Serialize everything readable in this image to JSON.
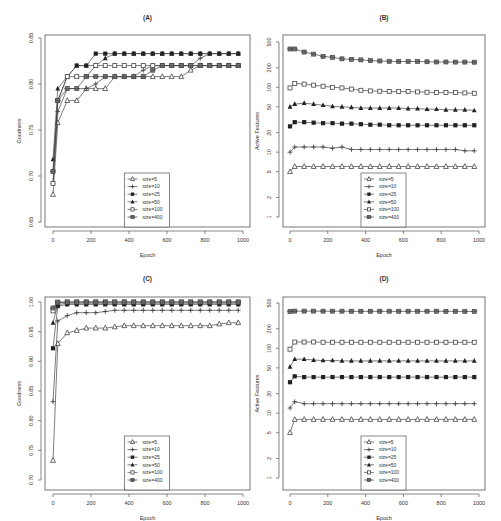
{
  "figure": {
    "panels_order": [
      "A",
      "B",
      "C",
      "D"
    ]
  },
  "legend": {
    "entries": [
      {
        "label": "size=5",
        "marker": "open-triangle"
      },
      {
        "label": "size=10",
        "marker": "plus"
      },
      {
        "label": "size=25",
        "marker": "filled-square"
      },
      {
        "label": "size=50",
        "marker": "filled-triangle"
      },
      {
        "label": "size=100",
        "marker": "open-square"
      },
      {
        "label": "size=400",
        "marker": "square-cross"
      }
    ]
  },
  "colors": {
    "line": "#444444",
    "axis": "#555555",
    "text": "#333333",
    "marker_fill": "#222222",
    "marker_open_fill": "#ffffff"
  },
  "chart_data": [
    {
      "id": "A",
      "title": "(A)",
      "type": "line",
      "xlabel": "Epoch",
      "ylabel": "Goodness",
      "yscale": "linear",
      "xlim": [
        0,
        1000
      ],
      "ylim": [
        0.65,
        0.85
      ],
      "xticks": [
        0,
        200,
        400,
        600,
        800,
        1000
      ],
      "yticks": [
        0.65,
        0.7,
        0.75,
        0.8,
        0.85
      ],
      "ytick_labels": [
        "0.65",
        "0.70",
        "0.75",
        "0.80",
        "0.85"
      ],
      "grid": false,
      "legend_position": "bottom-center",
      "x": [
        0,
        25,
        75,
        125,
        175,
        225,
        275,
        325,
        375,
        425,
        475,
        525,
        575,
        625,
        675,
        725,
        775,
        825,
        875,
        925,
        975
      ],
      "series": [
        {
          "name": "size=5",
          "values": [
            0.68,
            0.758,
            0.782,
            0.782,
            0.795,
            0.795,
            0.795,
            0.808,
            0.808,
            0.808,
            0.808,
            0.808,
            0.808,
            0.808,
            0.808,
            0.815,
            0.82,
            0.82,
            0.82,
            0.82,
            0.82
          ]
        },
        {
          "name": "size=10",
          "values": [
            0.692,
            0.77,
            0.795,
            0.795,
            0.795,
            0.8,
            0.808,
            0.808,
            0.808,
            0.808,
            0.815,
            0.82,
            0.82,
            0.82,
            0.82,
            0.82,
            0.828,
            0.833,
            0.833,
            0.833,
            0.833
          ]
        },
        {
          "name": "size=25",
          "values": [
            0.705,
            0.782,
            0.808,
            0.82,
            0.82,
            0.833,
            0.833,
            0.833,
            0.833,
            0.833,
            0.833,
            0.833,
            0.833,
            0.833,
            0.833,
            0.833,
            0.833,
            0.833,
            0.833,
            0.833,
            0.833
          ]
        },
        {
          "name": "size=50",
          "values": [
            0.718,
            0.795,
            0.808,
            0.82,
            0.82,
            0.82,
            0.828,
            0.833,
            0.833,
            0.833,
            0.833,
            0.833,
            0.833,
            0.833,
            0.833,
            0.833,
            0.833,
            0.833,
            0.833,
            0.833,
            0.833
          ]
        },
        {
          "name": "size=100",
          "values": [
            0.692,
            0.782,
            0.808,
            0.808,
            0.808,
            0.82,
            0.82,
            0.82,
            0.82,
            0.82,
            0.82,
            0.82,
            0.82,
            0.82,
            0.82,
            0.82,
            0.82,
            0.82,
            0.82,
            0.82,
            0.82
          ]
        },
        {
          "name": "size=400",
          "values": [
            0.705,
            0.782,
            0.795,
            0.795,
            0.808,
            0.808,
            0.808,
            0.808,
            0.808,
            0.808,
            0.808,
            0.815,
            0.82,
            0.82,
            0.82,
            0.82,
            0.82,
            0.82,
            0.82,
            0.82,
            0.82
          ]
        }
      ]
    },
    {
      "id": "B",
      "title": "(B)",
      "type": "line",
      "xlabel": "Epoch",
      "ylabel": "Active Features",
      "yscale": "log",
      "xlim": [
        0,
        1000
      ],
      "ylim": [
        1,
        500
      ],
      "xticks": [
        0,
        200,
        400,
        600,
        800,
        1000
      ],
      "yticks": [
        1,
        2,
        5,
        10,
        20,
        50,
        100,
        200,
        500
      ],
      "ytick_labels": [
        "1",
        "2",
        "5",
        "10",
        "20",
        "50",
        "100",
        "200",
        "500"
      ],
      "grid": false,
      "legend_position": "bottom-center",
      "x": [
        0,
        25,
        75,
        125,
        175,
        225,
        275,
        325,
        375,
        425,
        475,
        525,
        575,
        625,
        675,
        725,
        775,
        825,
        875,
        925,
        975
      ],
      "series": [
        {
          "name": "size=5",
          "values": [
            5,
            6,
            6,
            6,
            6,
            6,
            6,
            6,
            6,
            6,
            6,
            6,
            6,
            6,
            6,
            6,
            6,
            6,
            6,
            6,
            6
          ]
        },
        {
          "name": "size=10",
          "values": [
            10,
            12,
            12,
            12,
            12,
            11.5,
            12,
            11,
            11,
            11,
            11,
            11,
            11,
            11,
            11,
            11,
            11,
            11,
            11,
            10.5,
            10.5
          ]
        },
        {
          "name": "size=25",
          "values": [
            25,
            29,
            29,
            28.5,
            28,
            28,
            27.5,
            27.5,
            27,
            26.5,
            26.5,
            26,
            26,
            26,
            26,
            26,
            26,
            26,
            26,
            26,
            26
          ]
        },
        {
          "name": "size=50",
          "values": [
            50,
            55,
            57,
            55,
            53,
            51,
            50,
            49,
            48,
            48,
            48,
            48,
            48,
            47,
            47,
            46,
            46,
            45,
            45,
            45,
            44
          ]
        },
        {
          "name": "size=100",
          "values": [
            98,
            115,
            112,
            108,
            104,
            100,
            98,
            94,
            90,
            88,
            87,
            86,
            86,
            86,
            85,
            84,
            83,
            83,
            83,
            82,
            81
          ]
        },
        {
          "name": "size=400",
          "values": [
            390,
            390,
            350,
            325,
            300,
            290,
            275,
            270,
            265,
            258,
            255,
            252,
            250,
            250,
            250,
            248,
            246,
            246,
            245,
            245,
            244
          ]
        }
      ]
    },
    {
      "id": "C",
      "title": "(C)",
      "type": "line",
      "xlabel": "Epoch",
      "ylabel": "Goodness",
      "yscale": "linear",
      "xlim": [
        0,
        1000
      ],
      "ylim": [
        0.7,
        1.0
      ],
      "xticks": [
        0,
        200,
        400,
        600,
        800,
        1000
      ],
      "yticks": [
        0.7,
        0.75,
        0.8,
        0.85,
        0.9,
        0.95,
        1.0
      ],
      "ytick_labels": [
        "0.70",
        "0.75",
        "0.80",
        "0.85",
        "0.90",
        "0.95",
        "1.00"
      ],
      "grid": false,
      "legend_position": "bottom-center",
      "x": [
        0,
        25,
        75,
        125,
        175,
        225,
        275,
        325,
        375,
        425,
        475,
        525,
        575,
        625,
        675,
        725,
        775,
        825,
        875,
        925,
        975
      ],
      "series": [
        {
          "name": "size=5",
          "values": [
            0.733,
            0.93,
            0.948,
            0.952,
            0.956,
            0.956,
            0.956,
            0.958,
            0.96,
            0.96,
            0.96,
            0.96,
            0.96,
            0.96,
            0.96,
            0.96,
            0.96,
            0.96,
            0.963,
            0.965,
            0.965
          ]
        },
        {
          "name": "size=10",
          "values": [
            0.832,
            0.968,
            0.977,
            0.982,
            0.982,
            0.982,
            0.984,
            0.986,
            0.986,
            0.986,
            0.986,
            0.986,
            0.986,
            0.986,
            0.986,
            0.986,
            0.986,
            0.986,
            0.986,
            0.986,
            0.986
          ]
        },
        {
          "name": "size=25",
          "values": [
            0.922,
            0.993,
            0.996,
            0.996,
            0.996,
            0.996,
            0.996,
            0.996,
            0.996,
            0.996,
            0.996,
            0.996,
            0.996,
            0.996,
            0.996,
            0.996,
            0.996,
            0.996,
            0.996,
            0.996,
            0.996
          ]
        },
        {
          "name": "size=50",
          "values": [
            0.965,
            0.996,
            0.998,
            0.998,
            0.998,
            0.998,
            0.998,
            0.998,
            0.998,
            0.998,
            0.998,
            0.998,
            0.998,
            0.998,
            0.998,
            0.998,
            0.998,
            0.998,
            0.998,
            0.998,
            0.998
          ]
        },
        {
          "name": "size=100",
          "values": [
            0.985,
            0.999,
            1.0,
            1.0,
            1.0,
            1.0,
            1.0,
            1.0,
            1.0,
            1.0,
            1.0,
            1.0,
            1.0,
            1.0,
            1.0,
            1.0,
            1.0,
            1.0,
            1.0,
            1.0,
            1.0
          ]
        },
        {
          "name": "size=400",
          "values": [
            0.99,
            1.0,
            1.0,
            1.0,
            1.0,
            1.0,
            1.0,
            1.0,
            1.0,
            1.0,
            1.0,
            1.0,
            1.0,
            1.0,
            1.0,
            1.0,
            1.0,
            1.0,
            1.0,
            1.0,
            1.0
          ]
        }
      ]
    },
    {
      "id": "D",
      "title": "(D)",
      "type": "line",
      "xlabel": "Epoch",
      "ylabel": "Active Features",
      "yscale": "log",
      "xlim": [
        0,
        1000
      ],
      "ylim": [
        1,
        500
      ],
      "xticks": [
        0,
        200,
        400,
        600,
        800,
        1000
      ],
      "yticks": [
        1,
        2,
        5,
        10,
        20,
        50,
        100,
        200,
        500
      ],
      "ytick_labels": [
        "1",
        "2",
        "5",
        "10",
        "20",
        "50",
        "100",
        "200",
        "500"
      ],
      "grid": false,
      "legend_position": "bottom-center",
      "x": [
        0,
        25,
        75,
        125,
        175,
        225,
        275,
        325,
        375,
        425,
        475,
        525,
        575,
        625,
        675,
        725,
        775,
        825,
        875,
        925,
        975
      ],
      "series": [
        {
          "name": "size=5",
          "values": [
            5,
            8,
            8,
            8,
            8,
            8,
            8,
            8,
            8,
            8,
            8,
            8,
            8,
            8,
            8,
            8,
            8,
            8,
            8,
            8,
            8
          ]
        },
        {
          "name": "size=10",
          "values": [
            12,
            15,
            14,
            14,
            14,
            14,
            14,
            14,
            14,
            14,
            14,
            14,
            14,
            14,
            14,
            14,
            14,
            14,
            14,
            14,
            14
          ]
        },
        {
          "name": "size=25",
          "values": [
            30,
            37,
            36,
            36,
            36,
            36,
            36,
            36,
            36,
            36,
            36,
            36,
            36,
            36,
            36,
            36,
            36,
            36,
            36,
            36,
            36
          ]
        },
        {
          "name": "size=50",
          "values": [
            52,
            68,
            68,
            66,
            65,
            65,
            64,
            64,
            64,
            64,
            64,
            64,
            64,
            64,
            64,
            64,
            64,
            64,
            64,
            64,
            64
          ]
        },
        {
          "name": "size=100",
          "values": [
            97,
            125,
            125,
            125,
            124,
            124,
            124,
            124,
            124,
            124,
            124,
            124,
            124,
            124,
            124,
            124,
            124,
            124,
            124,
            124,
            124
          ]
        },
        {
          "name": "size=400",
          "values": [
            370,
            375,
            375,
            375,
            374,
            374,
            374,
            373,
            373,
            373,
            373,
            373,
            373,
            373,
            373,
            373,
            373,
            372,
            372,
            371,
            371
          ]
        }
      ]
    }
  ]
}
